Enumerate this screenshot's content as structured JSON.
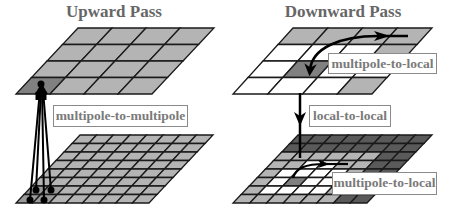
{
  "panels": {
    "upward": {
      "title": "Upward Pass",
      "label": "multipole-to-multipole",
      "coarse_grid": {
        "rows": 4,
        "cols": 4,
        "highlight_cell": [
          3,
          0
        ]
      },
      "fine_grid": {
        "rows": 8,
        "cols": 8,
        "highlight_cells": [
          [
            6,
            0
          ],
          [
            6,
            1
          ],
          [
            7,
            0
          ],
          [
            7,
            1
          ]
        ]
      }
    },
    "downward": {
      "title": "Downward Pass",
      "label_top": "multipole-to-local",
      "label_middle": "local-to-local",
      "label_bottom": "multipole-to-local",
      "coarse_grid": {
        "rows": 4,
        "cols": 4
      },
      "fine_grid": {
        "rows": 8,
        "cols": 8
      }
    }
  },
  "colors": {
    "cell_gray": "#b4b4b4",
    "cell_dark": "#808080",
    "cell_far": "#5a5a5a",
    "cell_white": "#ffffff",
    "grid_line": "#1a1a1a",
    "text_gray": "#777777"
  }
}
